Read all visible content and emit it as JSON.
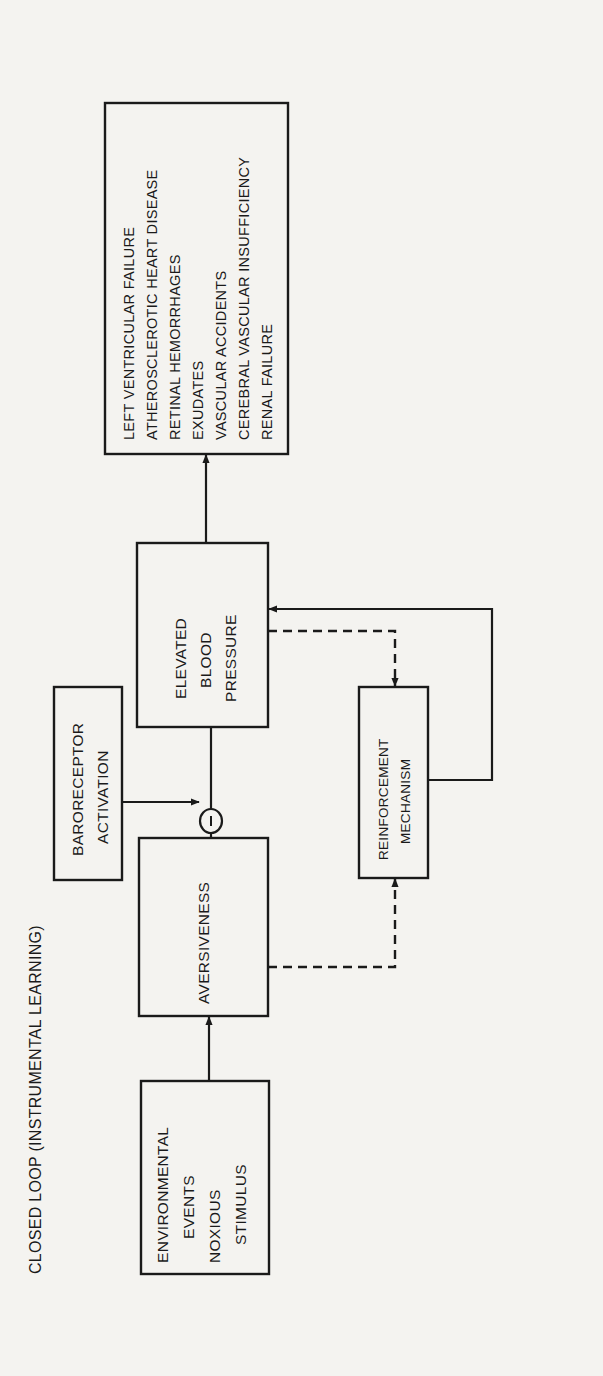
{
  "diagram": {
    "title": "CLOSED LOOP (INSTRUMENTAL LEARNING)",
    "orientation": "rotated 90 degrees counter-clockwise",
    "nodes": {
      "environmental": {
        "lines": [
          "ENVIRONMENTAL",
          "EVENTS",
          "NOXIOUS",
          "STIMULUS"
        ]
      },
      "aversiveness": {
        "label": "AVERSIVENESS"
      },
      "baroreceptor": {
        "lines": [
          "BARORECEPTOR",
          "ACTIVATION"
        ]
      },
      "inhibition": {
        "symbol": "−"
      },
      "elevated_bp": {
        "lines": [
          "ELEVATED",
          "BLOOD",
          "PRESSURE"
        ]
      },
      "reinforcement": {
        "lines": [
          "REINFORCEMENT",
          "MECHANISM"
        ]
      },
      "outcomes": {
        "items": [
          "LEFT VENTRICULAR FAILURE",
          "ATHEROSCLEROTIC HEART DISEASE",
          "RETINAL HEMORRHAGES",
          "EXUDATES",
          "VASCULAR ACCIDENTS",
          "CEREBRAL VASCULAR INSUFFICIENCY",
          "RENAL FAILURE"
        ]
      }
    },
    "edges": [
      {
        "from": "environmental",
        "to": "aversiveness",
        "style": "solid",
        "arrow": true
      },
      {
        "from": "aversiveness",
        "to": "elevated_bp",
        "style": "solid",
        "via": "inhibition"
      },
      {
        "from": "baroreceptor",
        "to": "inhibition",
        "style": "solid",
        "arrow": true
      },
      {
        "from": "elevated_bp",
        "to": "outcomes",
        "style": "solid",
        "arrow": true
      },
      {
        "from": "aversiveness",
        "to": "reinforcement",
        "style": "dashed",
        "arrow": true
      },
      {
        "from": "elevated_bp",
        "to": "reinforcement",
        "style": "dashed",
        "arrow": true
      },
      {
        "from": "reinforcement",
        "to": "elevated_bp",
        "style": "solid",
        "arrow": true
      }
    ]
  }
}
